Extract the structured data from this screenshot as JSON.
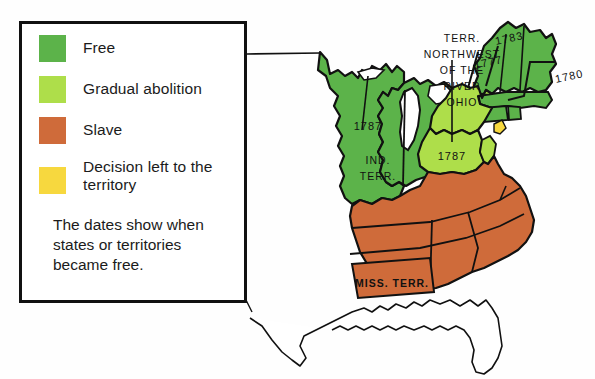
{
  "map": {
    "title": "Slavery and freedom in the United States, early 1800s",
    "legend": {
      "items": [
        {
          "label": "Free",
          "color": "#5cb34a",
          "name": "free"
        },
        {
          "label": "Gradual abolition",
          "color": "#aede4a",
          "name": "gradual-abolition"
        },
        {
          "label": "Slave",
          "color": "#cf6b3a",
          "name": "slave"
        },
        {
          "label": "Decision left to\nthe territory",
          "line1": "Decision left to",
          "line2": "the territory",
          "color": "#f7d83e",
          "name": "decision-left-to-territory"
        }
      ],
      "note": {
        "line1": "The dates show when",
        "line2": "states or territories",
        "line3": "became free."
      }
    },
    "labels": {
      "northwest_territory": {
        "line1": "TERR.",
        "line2": "NORTHWEST",
        "line3": "OF THE",
        "line4": "RIVER",
        "line5": "OHIO"
      },
      "indiana_territory": {
        "line1": "IND.",
        "line2": "TERR."
      },
      "mississippi_territory": "MISS. TERR."
    },
    "dates": [
      {
        "value": "1787",
        "name": "date-1787-northwest-upper"
      },
      {
        "value": "1787",
        "name": "date-1787-northwest-lower"
      },
      {
        "value": "1783",
        "name": "date-1783-new-hampshire"
      },
      {
        "value": "1777",
        "name": "date-1777-vermont"
      },
      {
        "value": "1780",
        "name": "date-1780-rhode-island"
      }
    ],
    "colors": {
      "free": "#5cb34a",
      "gradual": "#aede4a",
      "slave": "#cf6b3a",
      "territory_decision": "#f7d83e",
      "outline": "#111111",
      "unorganized": "#ffffff",
      "background": "#ffffff"
    }
  }
}
